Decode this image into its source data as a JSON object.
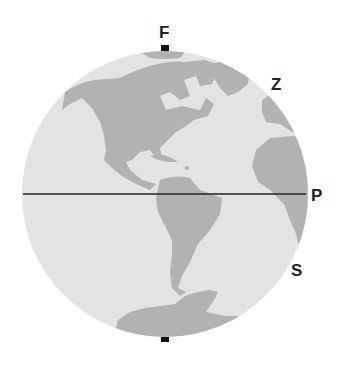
{
  "diagram": {
    "type": "globe-orthographic",
    "labels": {
      "top": "F",
      "upper_right": "Z",
      "right": "P",
      "lower_right": "S"
    },
    "colors": {
      "ocean": "#e3e3e3",
      "land": "#b2b2b2",
      "line": "#222222",
      "label": "#222222"
    },
    "features": [
      "North America",
      "Central America",
      "South America",
      "Greenland",
      "Western Europe",
      "Africa",
      "Antarctica",
      "Equator line",
      "Pole markers"
    ]
  }
}
